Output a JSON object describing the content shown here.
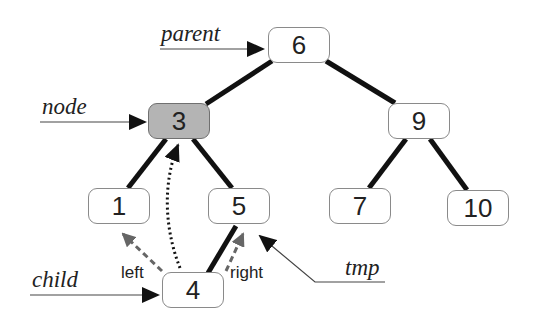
{
  "diagram": {
    "type": "binary-search-tree-deletion",
    "nodes": [
      {
        "id": "n6",
        "value": "6",
        "highlighted": false
      },
      {
        "id": "n3",
        "value": "3",
        "highlighted": true
      },
      {
        "id": "n9",
        "value": "9",
        "highlighted": false
      },
      {
        "id": "n1",
        "value": "1",
        "highlighted": false
      },
      {
        "id": "n5",
        "value": "5",
        "highlighted": false
      },
      {
        "id": "n7",
        "value": "7",
        "highlighted": false
      },
      {
        "id": "n10",
        "value": "10",
        "highlighted": false
      },
      {
        "id": "n4",
        "value": "4",
        "highlighted": false
      }
    ],
    "edges": [
      {
        "from": "6",
        "to": "3",
        "style": "solid"
      },
      {
        "from": "6",
        "to": "9",
        "style": "solid"
      },
      {
        "from": "3",
        "to": "1",
        "style": "solid"
      },
      {
        "from": "3",
        "to": "5",
        "style": "solid"
      },
      {
        "from": "9",
        "to": "7",
        "style": "solid"
      },
      {
        "from": "9",
        "to": "10",
        "style": "solid"
      },
      {
        "from": "5",
        "to": "4",
        "style": "solid"
      },
      {
        "from": "4",
        "to": "3",
        "style": "dotted-arrow"
      },
      {
        "from": "4",
        "to": "1",
        "style": "dashed-arrow",
        "label": "left"
      },
      {
        "from": "4",
        "to": "5",
        "style": "dashed-arrow",
        "label": "right"
      }
    ],
    "pointers": [
      {
        "name": "parent",
        "target": "6"
      },
      {
        "name": "node",
        "target": "3"
      },
      {
        "name": "child",
        "target": "4"
      },
      {
        "name": "tmp",
        "target": "5"
      }
    ],
    "edge_labels": {
      "left": "left",
      "right": "right"
    },
    "colors": {
      "highlight_fill": "#b4b4b4",
      "edge": "#111111",
      "dashed_arrow": "#666666"
    }
  }
}
